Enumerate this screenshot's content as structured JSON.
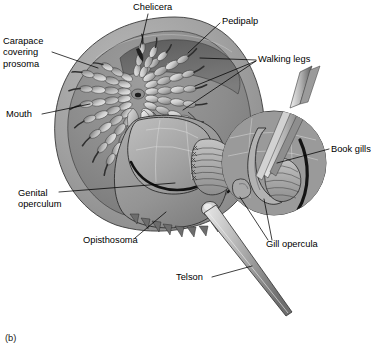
{
  "figure": {
    "caption": "(b)",
    "view": "ventral",
    "background_color": "#ffffff",
    "ink_color": "#000000"
  },
  "labels": [
    {
      "id": "carapace",
      "name": "carapace-covering-prosoma",
      "lines": [
        "Carapace",
        "covering",
        "prosoma"
      ],
      "text": "Carapace covering prosoma",
      "x": 3,
      "y": 44,
      "anchor": "start",
      "leader": "M 52,52 L 98,68"
    },
    {
      "id": "chelicera",
      "name": "chelicera",
      "lines": [
        "Chelicera"
      ],
      "text": "Chelicera",
      "x": 133,
      "y": 10,
      "anchor": "start",
      "leader": "M 148,14 L 140,48"
    },
    {
      "id": "pedipalp",
      "name": "pedipalp",
      "lines": [
        "Pedipalp"
      ],
      "text": "Pedipalp",
      "x": 222,
      "y": 24,
      "anchor": "start",
      "leader": "M 220,23 L 188,53"
    },
    {
      "id": "walking-legs",
      "name": "walking-legs",
      "lines": [
        "Walking legs"
      ],
      "text": "Walking legs",
      "x": 258,
      "y": 62,
      "anchor": "start",
      "leader": "M 256,60 L 200,58 M 256,61 L 195,86 M 256,61 L 183,110"
    },
    {
      "id": "mouth",
      "name": "mouth",
      "lines": [
        "Mouth"
      ],
      "text": "Mouth",
      "x": 6,
      "y": 117,
      "anchor": "start",
      "leader": "M 42,114 L 90,104"
    },
    {
      "id": "book-gills",
      "name": "book-gills",
      "lines": [
        "Book gills"
      ],
      "text": "Book gills",
      "x": 331,
      "y": 152,
      "anchor": "start",
      "leader": "M 329,149 L 277,163"
    },
    {
      "id": "genital-operculum",
      "name": "genital-operculum",
      "lines": [
        "Genital",
        "operculum"
      ],
      "text": "Genital operculum",
      "x": 18,
      "y": 196,
      "anchor": "start",
      "leader": "M 59,192 L 175,183"
    },
    {
      "id": "opisthosoma",
      "name": "opisthosoma",
      "lines": [
        "Opisthosoma"
      ],
      "text": "Opisthosoma",
      "x": 83,
      "y": 243,
      "anchor": "start",
      "leader": "M 135,238 L 166,212"
    },
    {
      "id": "gill-opercula",
      "name": "gill-opercula",
      "lines": [
        "Gill opercula"
      ],
      "text": "Gill opercula",
      "x": 266,
      "y": 247,
      "anchor": "start",
      "leader": "M 268,240 L 240,197 M 272,240 L 264,199"
    },
    {
      "id": "telson",
      "name": "telson",
      "lines": [
        "Telson"
      ],
      "text": "Telson",
      "x": 176,
      "y": 280,
      "anchor": "start",
      "leader": "M 212,277 L 252,266"
    }
  ],
  "palette": {
    "carapace_rim": "#a3a3a3",
    "carapace_inner": "#8f8f8f",
    "carapace_shadow": "#6f6f6f",
    "body_mid": "#9a9a9a",
    "body_light": "#c9c9c9",
    "body_dark": "#636363",
    "gill_dark": "#242424",
    "telson_light": "#d5d5d5",
    "telson_dark": "#6a6a6a",
    "outline": "#2b2b2b",
    "white": "#ffffff"
  },
  "anatomy": {
    "parts": [
      "carapace (prosoma shield)",
      "chelicera",
      "pedipalp",
      "walking legs",
      "mouth",
      "genital operculum",
      "book gills",
      "gill opercula",
      "opisthosoma",
      "telson"
    ],
    "inset": {
      "name": "magnified gill detail",
      "shape": "circle",
      "cx": 274,
      "cy": 163,
      "r": 52,
      "tools": "two probe/forceps tines lifting an operculum"
    }
  }
}
